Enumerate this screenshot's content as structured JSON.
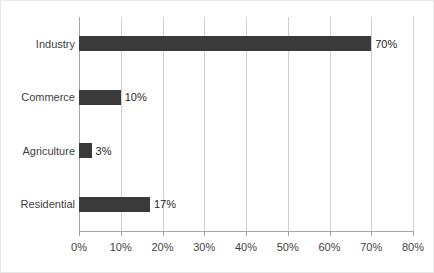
{
  "chart_data": {
    "type": "bar",
    "orientation": "horizontal",
    "title": "",
    "xlabel": "",
    "ylabel": "",
    "categories": [
      "Industry",
      "Commerce",
      "Agriculture",
      "Residential"
    ],
    "values": [
      70,
      10,
      3,
      17
    ],
    "data_labels": [
      "70%",
      "10%",
      "3%",
      "17%"
    ],
    "xlim": [
      0,
      80
    ],
    "xticks": [
      0,
      10,
      20,
      30,
      40,
      50,
      60,
      70,
      80
    ],
    "xtick_labels": [
      "0%",
      "10%",
      "20%",
      "30%",
      "40%",
      "50%",
      "60%",
      "70%",
      "80%"
    ],
    "grid": "vertical",
    "legend": "none",
    "series": [
      {
        "name": "",
        "values": [
          70,
          10,
          3,
          17
        ]
      }
    ],
    "colors": {
      "bar": "#3a3a3a",
      "gridline": "#d0d0d0",
      "axis": "#a6a6a6",
      "label_text": "#3f3f3f",
      "value_text": "#262626",
      "background": "#ffffff",
      "frame_border": "#e8e8e8"
    }
  }
}
